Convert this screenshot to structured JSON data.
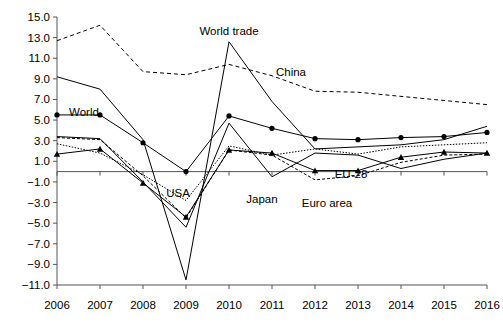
{
  "chart_data": {
    "type": "line",
    "title": "",
    "subtitle": "",
    "xlabel": "",
    "ylabel": "",
    "categories": [
      2006,
      2007,
      2008,
      2009,
      2010,
      2011,
      2012,
      2013,
      2014,
      2015,
      2016
    ],
    "x": [
      "2006",
      "2007",
      "2008",
      "2009",
      "2010",
      "2011",
      "2012",
      "2013",
      "2014",
      "2015",
      "2016"
    ],
    "xtick_labels": [
      "2006",
      "2007",
      "2008",
      "2009",
      "2010",
      "2011",
      "2012",
      "2013",
      "2014",
      "2015",
      "2016"
    ],
    "ytick_labels": [
      "15.0",
      "13.0",
      "11.0",
      "9.0",
      "7.0",
      "5.0",
      "3.0",
      "1.0",
      "-1.0",
      "-3.0",
      "-5.0",
      "-7.0",
      "-9.0",
      "-11.0"
    ],
    "ytick_values": [
      15.0,
      13.0,
      11.0,
      9.0,
      7.0,
      5.0,
      3.0,
      1.0,
      -1.0,
      -3.0,
      -5.0,
      -7.0,
      -9.0,
      -11.0
    ],
    "ylim": [
      -11.0,
      15.0
    ],
    "ytick_step": 2.0,
    "grid": false,
    "legend_position": "inline-annotations",
    "zero_line": 0.0,
    "series": [
      {
        "name": "World trade",
        "label": "World trade",
        "style": "solid",
        "marker": "none",
        "color": "#000000",
        "values": [
          9.2,
          8.0,
          3.1,
          -10.5,
          12.6,
          6.8,
          2.2,
          2.4,
          2.6,
          3.1,
          4.4
        ]
      },
      {
        "name": "China",
        "label": "China",
        "style": "dashed",
        "marker": "none",
        "color": "#000000",
        "values": [
          12.7,
          14.2,
          9.7,
          9.4,
          10.4,
          9.3,
          7.8,
          7.7,
          7.3,
          6.9,
          6.5
        ]
      },
      {
        "name": "World",
        "label": "World",
        "style": "solid",
        "marker": "circle",
        "color": "#000000",
        "values": [
          5.5,
          5.5,
          2.8,
          0.0,
          5.4,
          4.2,
          3.2,
          3.1,
          3.3,
          3.4,
          3.8
        ]
      },
      {
        "name": "USA",
        "label": "USA",
        "style": "dotted",
        "marker": "none",
        "color": "#000000",
        "values": [
          2.7,
          1.8,
          -0.3,
          -2.8,
          2.5,
          1.6,
          2.2,
          1.7,
          2.4,
          2.6,
          2.8
        ]
      },
      {
        "name": "EU-28",
        "label": "EU-28",
        "style": "solid",
        "marker": "triangle",
        "color": "#000000",
        "values": [
          1.7,
          2.2,
          -1.1,
          -4.4,
          2.1,
          1.8,
          0.1,
          0.1,
          1.4,
          1.9,
          1.8
        ]
      },
      {
        "name": "Euro area",
        "label": "Euro area",
        "style": "dashed-fine",
        "marker": "none",
        "color": "#000000",
        "values": [
          3.3,
          3.1,
          -0.4,
          -4.5,
          2.1,
          1.6,
          -0.8,
          -0.4,
          0.9,
          1.6,
          1.7
        ]
      },
      {
        "name": "Japan",
        "label": "Japan",
        "style": "solid",
        "marker": "none",
        "color": "#000000",
        "values": [
          3.4,
          3.2,
          -1.0,
          -5.4,
          4.7,
          -0.5,
          1.8,
          1.6,
          0.3,
          1.2,
          1.8
        ]
      }
    ],
    "annotations": [
      {
        "text": "World trade",
        "series": "World trade",
        "x_px": 229,
        "y_px": 35
      },
      {
        "text": "China",
        "series": "China",
        "x_px": 291,
        "y_px": 76
      },
      {
        "text": "World",
        "series": "World",
        "x_px": 84,
        "y_px": 116
      },
      {
        "text": "USA",
        "series": "USA",
        "x_px": 178,
        "y_px": 197
      },
      {
        "text": "Japan",
        "series": "Japan",
        "x_px": 262,
        "y_px": 203
      },
      {
        "text": "Euro area",
        "series": "Euro area",
        "x_px": 327,
        "y_px": 207
      },
      {
        "text": "EU-28",
        "series": "EU-28",
        "x_px": 351,
        "y_px": 178
      }
    ]
  },
  "axes": {
    "y_top_px": 17,
    "y_bottom_px": 285,
    "x_left_px": 57,
    "x_right_px": 487,
    "axis_color": "#555555"
  }
}
